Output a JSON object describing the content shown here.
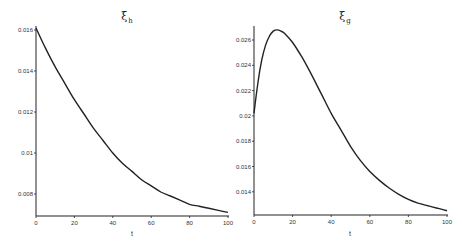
{
  "chart_data": [
    {
      "type": "line",
      "title": "ξ_h",
      "title_symbol": "ξ",
      "title_subscript": "h",
      "xlabel": "t",
      "ylabel": "",
      "xlim": [
        0,
        100
      ],
      "ylim": [
        0.007,
        0.0162
      ],
      "xticks": [
        "0",
        "20",
        "40",
        "60",
        "80",
        "100"
      ],
      "yticks": [
        "0.008",
        "0.01",
        "0.012",
        "0.014",
        "0.016"
      ],
      "grid": false,
      "legend": null,
      "series": [
        {
          "name": "ξ_h",
          "x": [
            0,
            5,
            10,
            15,
            20,
            25,
            30,
            35,
            40,
            45,
            50,
            55,
            60,
            65,
            70,
            75,
            80,
            85,
            90,
            95,
            100
          ],
          "values": [
            0.0161,
            0.0151,
            0.0142,
            0.0134,
            0.0126,
            0.0119,
            0.0112,
            0.0106,
            0.01,
            0.0095,
            0.0091,
            0.0087,
            0.0084,
            0.0081,
            0.0079,
            0.0077,
            0.0075,
            0.0074,
            0.0073,
            0.0072,
            0.0071
          ]
        }
      ]
    },
    {
      "type": "line",
      "title": "ξ_g",
      "title_symbol": "ξ",
      "title_subscript": "g",
      "xlabel": "t",
      "ylabel": "",
      "xlim": [
        0,
        100
      ],
      "ylim": [
        0.0122,
        0.0272
      ],
      "xticks": [
        "0",
        "20",
        "40",
        "60",
        "80",
        "100"
      ],
      "yticks": [
        "0.014",
        "0.016",
        "0.018",
        "0.02",
        "0.022",
        "0.024",
        "0.026"
      ],
      "grid": false,
      "legend": null,
      "series": [
        {
          "name": "ξ_g",
          "x": [
            0,
            2,
            4,
            6,
            8,
            10,
            12,
            14,
            16,
            20,
            25,
            30,
            35,
            40,
            45,
            50,
            55,
            60,
            65,
            70,
            75,
            80,
            85,
            90,
            95,
            100
          ],
          "values": [
            0.0202,
            0.0226,
            0.0244,
            0.0256,
            0.0263,
            0.0267,
            0.0268,
            0.0267,
            0.0265,
            0.0258,
            0.0246,
            0.0232,
            0.0217,
            0.0202,
            0.0189,
            0.0176,
            0.0165,
            0.0156,
            0.0149,
            0.0143,
            0.0138,
            0.0134,
            0.0131,
            0.0129,
            0.0127,
            0.0125
          ]
        }
      ]
    }
  ]
}
